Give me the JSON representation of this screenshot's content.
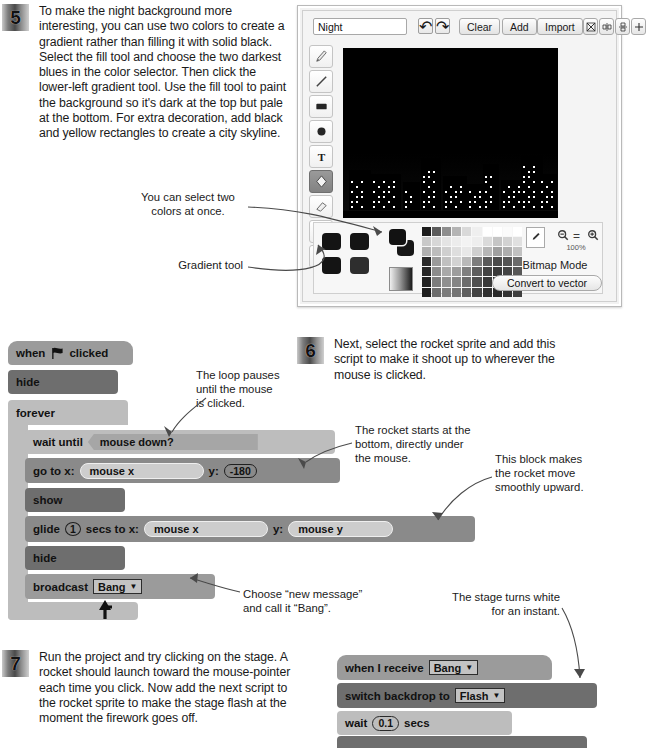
{
  "steps": [
    {
      "number": "5",
      "text": "To make the night background more interesting, you can use two colors to create a gradient rather than filling it with solid black. Select the fill tool and choose the two darkest blues in the color selector. Then click the lower-left gradient tool. Use the fill tool to paint the background so it's dark at the top but pale at the bottom. For extra decoration, add black and yellow rectangles to create a city skyline."
    },
    {
      "number": "6",
      "text": "Next, select the rocket sprite and add this script to make it shoot up to wherever the mouse is clicked."
    },
    {
      "number": "7",
      "text": "Run the project and try clicking on the stage. A rocket should launch toward the mouse-pointer each time you click. Now add the next script to the rocket sprite to make the stage flash at the moment the firework goes off."
    }
  ],
  "annotations": {
    "two_colors": "You can select two\ncolors at once.",
    "gradient_tool": "Gradient tool",
    "loop_pauses": "The loop pauses\nuntil the mouse\nis clicked.",
    "rocket_starts": "The rocket starts at the\nbottom, directly under\nthe mouse.",
    "this_block": "This block makes\nthe rocket move\nsmoothly upward.",
    "choose_new_message": "Choose “new message”\nand call it “Bang”.",
    "stage_turns_white": "The stage turns white\nfor an instant."
  },
  "paint_editor": {
    "costume_name": "Night",
    "costume_name_placeholder": "Costume name",
    "undo_label": "↶",
    "redo_label": "↷",
    "buttons": [
      "Clear",
      "Add",
      "Import"
    ],
    "right_icons": [
      "crop-icon",
      "flip-horizontal-icon",
      "flip-vertical-icon",
      "set-center-icon"
    ],
    "tools": [
      {
        "name": "paintbrush-tool",
        "selected": false
      },
      {
        "name": "line-tool",
        "selected": false
      },
      {
        "name": "rectangle-tool",
        "selected": false
      },
      {
        "name": "ellipse-tool",
        "selected": false
      },
      {
        "name": "text-tool",
        "selected": false
      },
      {
        "name": "fill-tool",
        "selected": true
      },
      {
        "name": "eraser-tool",
        "selected": false
      },
      {
        "name": "select-tool",
        "selected": false
      },
      {
        "name": "stamp-tool",
        "selected": false
      }
    ],
    "gradient_buttons": [
      "solid-fill",
      "horizontal-gradient",
      "vertical-gradient",
      "radial-gradient"
    ],
    "foreground_color": "#111111",
    "background_color": "#1b1b1b",
    "zoom_out_label": "⊖",
    "zoom_reset_label": "=",
    "zoom_in_label": "⊕",
    "zoom_level": "100%",
    "bitmap_mode_label": "Bitmap Mode",
    "convert_button_label": "Convert to vector",
    "eyedropper": "eyedropper-icon",
    "palette_colors": [
      [
        "#1c1c1c",
        "#5b5b5b",
        "#8d8d8d",
        "#b4b4b4",
        "#d9d9d9",
        "#efefef",
        "#ffffff",
        "#ffffff",
        "#fbfbfb",
        "#ffffff"
      ],
      [
        "#c9c9c9",
        "#d7d7d7",
        "#e4e4e4",
        "#ececec",
        "#f3f3f3",
        "#eeeeee",
        "#dadada",
        "#c5c5c5",
        "#d2d2d2",
        "#e0e0e0"
      ],
      [
        "#b0b0b0",
        "#bcbcbc",
        "#cfcfcf",
        "#dedede",
        "#e8e8e8",
        "#cfcfcf",
        "#b6b6b6",
        "#9f9f9f",
        "#adadad",
        "#c1c1c1"
      ],
      [
        "#2a2a2a",
        "#9a9a9a",
        "#c0c0c0",
        "#d2d2d2",
        "#b9b9b9",
        "#7d7d7d",
        "#5a5a5a",
        "#4a4a4a",
        "#545454",
        "#6b6b6b"
      ],
      [
        "#272727",
        "#8c8c8c",
        "#a9a9a9",
        "#9d9d9d",
        "#808080",
        "#5d5d5d",
        "#434343",
        "#3a3a3a",
        "#444444",
        "#575757"
      ],
      [
        "#222222",
        "#7c7c7c",
        "#8f8f8f",
        "#858585",
        "#6c6c6c",
        "#4e4e4e",
        "#383838",
        "#303030",
        "#3a3a3a",
        "#4a4a4a"
      ],
      [
        "#1e1e1e",
        "#6d6d6d",
        "#7c7c7c",
        "#747474",
        "#5e5e5e",
        "#434343",
        "#303030",
        "#292929",
        "#323232",
        "#3f3f3f"
      ]
    ]
  },
  "script_rocket": {
    "blocks": [
      {
        "name": "when-flag-clicked",
        "pre": "when",
        "icon": "green-flag-icon",
        "post": "clicked"
      },
      {
        "name": "hide-block",
        "label": "hide"
      },
      {
        "name": "forever-block",
        "label": "forever"
      },
      {
        "name": "wait-until-block",
        "label": "wait until",
        "condition": "mouse down?"
      },
      {
        "name": "go-to-xy-block",
        "label": "go to x:",
        "x_value": "mouse x",
        "y_label": "y:",
        "y_value": "-180"
      },
      {
        "name": "show-block",
        "label": "show"
      },
      {
        "name": "glide-block",
        "label": "glide",
        "secs": "1",
        "mid": "secs to x:",
        "x_value": "mouse x",
        "y_label": "y:",
        "y_value": "mouse y"
      },
      {
        "name": "hide-block-2",
        "label": "hide"
      },
      {
        "name": "broadcast-block",
        "label": "broadcast",
        "message": "Bang"
      }
    ]
  },
  "script_flash": {
    "blocks": [
      {
        "name": "when-i-receive-block",
        "label": "when I receive",
        "message": "Bang"
      },
      {
        "name": "switch-backdrop-block",
        "label": "switch backdrop to",
        "backdrop": "Flash"
      },
      {
        "name": "wait-secs-block",
        "label": "wait",
        "value": "0.1",
        "suffix": "secs"
      }
    ]
  },
  "colors": {
    "events_block": "#9b9b9b",
    "looks_block": "#6e6e6e",
    "control_block": "#bdbdbd",
    "motion_block": "#8a8a8a",
    "sensing_block": "#a6a6a6",
    "input_oval": "#cdcdcd"
  }
}
